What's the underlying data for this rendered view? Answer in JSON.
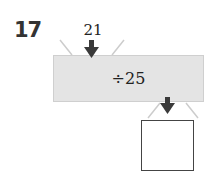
{
  "problem": {
    "number": "17",
    "input_value": "21",
    "operation": "÷25",
    "answer": ""
  },
  "colors": {
    "machine_fill": "#e4e4e4",
    "arrow": "#3a3a3a",
    "funnel_lines": "#cccccc"
  },
  "icons": [
    "arrow-down-icon",
    "arrow-down-icon"
  ]
}
